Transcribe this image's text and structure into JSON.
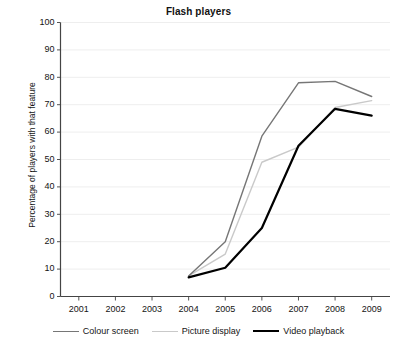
{
  "chart_data": {
    "type": "line",
    "title": "Flash players",
    "xlabel": "",
    "ylabel": "Percentage of players with that feature",
    "x": [
      2001,
      2002,
      2003,
      2004,
      2005,
      2006,
      2007,
      2008,
      2009
    ],
    "xtick_labels": [
      "2001",
      "2002",
      "2003",
      "2004",
      "2005",
      "2006",
      "2007",
      "2008",
      "2009"
    ],
    "ytick_labels": [
      "0",
      "10",
      "20",
      "30",
      "40",
      "50",
      "60",
      "70",
      "80",
      "90",
      "100"
    ],
    "ytick_values": [
      0,
      10,
      20,
      30,
      40,
      50,
      60,
      70,
      80,
      90,
      100
    ],
    "xlim": [
      2000.5,
      2009.5
    ],
    "ylim": [
      0,
      100
    ],
    "grid": true,
    "grid_axis": "y",
    "legend_position": "bottom",
    "series": [
      {
        "name": "Colour screen",
        "color": "#767676",
        "width": 1.4,
        "x": [
          2004,
          2005,
          2006,
          2007,
          2008,
          2009
        ],
        "values": [
          7.5,
          20,
          58.5,
          78,
          78.5,
          73
        ]
      },
      {
        "name": "Picture display",
        "color": "#c9c9c9",
        "width": 1.4,
        "x": [
          2004,
          2005,
          2006,
          2007,
          2008,
          2009
        ],
        "values": [
          7.5,
          15.5,
          49,
          54.5,
          69,
          71.5
        ]
      },
      {
        "name": "Video playback",
        "color": "#000000",
        "width": 2.2,
        "x": [
          2004,
          2005,
          2006,
          2007,
          2008,
          2009
        ],
        "values": [
          7,
          10.5,
          25,
          55,
          68.5,
          66
        ]
      }
    ]
  },
  "legend": {
    "items": [
      {
        "label": "Colour screen",
        "color": "#767676",
        "width": 1.4
      },
      {
        "label": "Picture display",
        "color": "#c9c9c9",
        "width": 1.4
      },
      {
        "label": "Video playback",
        "color": "#000000",
        "width": 2.2
      }
    ]
  },
  "axes": {
    "spine_color": "#444444",
    "grid_color": "#eeeeee",
    "tick_color": "#555555"
  }
}
